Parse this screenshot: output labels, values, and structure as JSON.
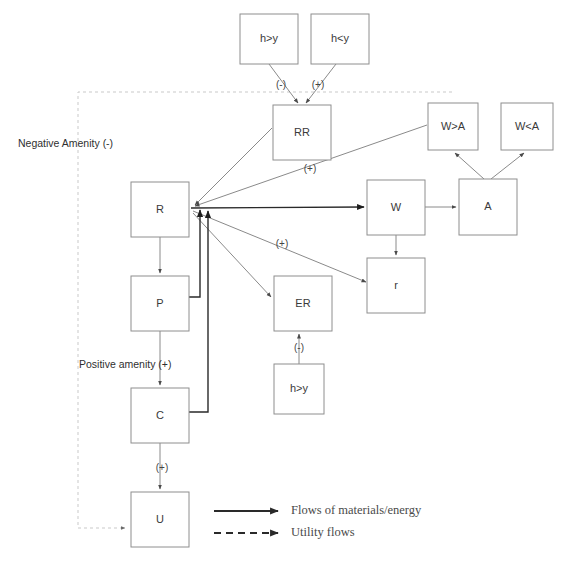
{
  "diagram": {
    "colors": {
      "box_stroke": "#8e8e8e",
      "flow_line": "#8a8a8a",
      "flow_line_dark": "#2a2a2a",
      "utility_line": "#c9c9c9",
      "text": "#3a3a3a",
      "background": "#ffffff"
    },
    "nodes": [
      {
        "id": "h_gt_y_top",
        "label": "h>y",
        "x": 240,
        "y": 14,
        "w": 58,
        "h": 50
      },
      {
        "id": "h_lt_y_top",
        "label": "h<y",
        "x": 311,
        "y": 14,
        "w": 58,
        "h": 50
      },
      {
        "id": "RR",
        "label": "RR",
        "x": 273,
        "y": 105,
        "w": 58,
        "h": 55
      },
      {
        "id": "W_gt_A",
        "label": "W>A",
        "x": 428,
        "y": 103,
        "w": 50,
        "h": 47
      },
      {
        "id": "W_lt_A",
        "label": "W<A",
        "x": 501,
        "y": 103,
        "w": 52,
        "h": 47
      },
      {
        "id": "R",
        "label": "R",
        "x": 131,
        "y": 182,
        "w": 58,
        "h": 55
      },
      {
        "id": "W",
        "label": "W",
        "x": 367,
        "y": 180,
        "w": 58,
        "h": 55
      },
      {
        "id": "A",
        "label": "A",
        "x": 459,
        "y": 179,
        "w": 58,
        "h": 56
      },
      {
        "id": "r",
        "label": "r",
        "x": 367,
        "y": 258,
        "w": 58,
        "h": 55
      },
      {
        "id": "P",
        "label": "P",
        "x": 131,
        "y": 276,
        "w": 58,
        "h": 55
      },
      {
        "id": "ER",
        "label": "ER",
        "x": 274,
        "y": 276,
        "w": 58,
        "h": 55
      },
      {
        "id": "h_gt_y_low",
        "label": "h>y",
        "x": 274,
        "y": 364,
        "w": 50,
        "h": 50
      },
      {
        "id": "C",
        "label": "C",
        "x": 131,
        "y": 388,
        "w": 58,
        "h": 55
      },
      {
        "id": "U",
        "label": "U",
        "x": 131,
        "y": 492,
        "w": 58,
        "h": 55
      }
    ],
    "edge_labels": [
      {
        "id": "rr-from-hgty",
        "text": "(-)",
        "x": 281,
        "y": 85
      },
      {
        "id": "rr-from-hlty",
        "text": "(+)",
        "x": 318,
        "y": 85
      },
      {
        "id": "rr-to-r",
        "text": "(+)",
        "x": 310,
        "y": 169
      },
      {
        "id": "r-to-er",
        "text": "(+)",
        "x": 282,
        "y": 244
      },
      {
        "id": "er-from-hgty",
        "text": "(-)",
        "x": 299,
        "y": 348
      },
      {
        "id": "c-to-u",
        "text": "(+)",
        "x": 162,
        "y": 468
      }
    ],
    "zones": [
      {
        "id": "negative-amenity",
        "text": "Negative Amenity (-)",
        "x": 18,
        "y": 144
      },
      {
        "id": "positive-amenity",
        "text": "Positive amenity (+)",
        "x": 79,
        "y": 365
      }
    ],
    "legend": {
      "items": [
        {
          "id": "materials-energy",
          "style": "solid",
          "label": "Flows of materials/energy"
        },
        {
          "id": "utility-flows",
          "style": "dashed",
          "label": "Utility flows"
        }
      ]
    }
  }
}
